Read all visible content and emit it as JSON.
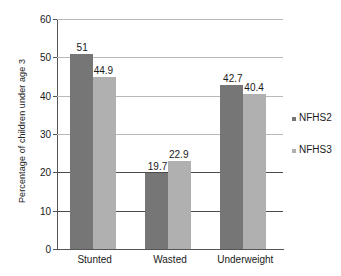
{
  "chart_data": {
    "type": "bar",
    "title": "",
    "xlabel": "",
    "ylabel": "Percentage of children under age 3",
    "categories": [
      "Stunted",
      "Wasted",
      "Underweight"
    ],
    "series": [
      {
        "name": "NFHS2",
        "color": "#767676",
        "values": [
          51,
          19.7,
          42.7
        ],
        "labels": [
          "51",
          "19.7",
          "42.7"
        ]
      },
      {
        "name": "NFHS3",
        "color": "#b0b0b0",
        "values": [
          44.9,
          22.9,
          40.4
        ],
        "labels": [
          "44.9",
          "22.9",
          "40.4"
        ]
      }
    ],
    "ylim": [
      0,
      60
    ],
    "yticks": [
      0,
      10,
      20,
      30,
      40,
      50,
      60
    ],
    "ytick_labels": [
      "0",
      "10",
      "20",
      "30",
      "40",
      "50",
      "60"
    ],
    "grid": true,
    "grid_emphasis": [
      10,
      20
    ],
    "legend_position": "right",
    "legend": [
      "NFHS2",
      "NFHS3"
    ]
  }
}
